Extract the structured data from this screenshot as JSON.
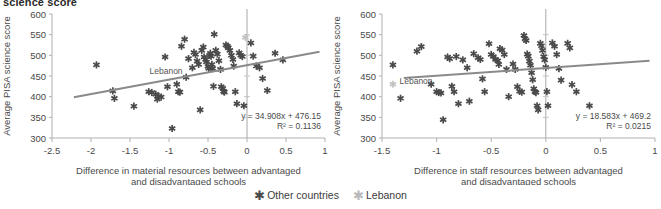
{
  "figure": {
    "title": "science score"
  },
  "legend": {
    "position": "bottom-center",
    "items": [
      {
        "label": "Other countries",
        "marker": "asterisk-icon",
        "color": "#4a4a4a"
      },
      {
        "label": "Lebanon",
        "marker": "asterisk-icon",
        "color": "#b9b9b9"
      }
    ]
  },
  "chart_data": [
    {
      "type": "scatter",
      "panel": "left",
      "title": "",
      "xlabel": "Difference in material resources between advantaged and disadvantaged schools",
      "xlabel_line1": "Difference in material resources between advantaged",
      "xlabel_line2": "and disadvantaged schools",
      "ylabel": "Average PISA science score",
      "xlim": [
        -2.5,
        1
      ],
      "ylim": [
        300,
        600
      ],
      "xticks": [
        "-2.5",
        "-2",
        "-1.5",
        "-1",
        "-0.5",
        "0",
        "0.5",
        "1"
      ],
      "xtick_values": [
        -2.5,
        -2,
        -1.5,
        -1,
        -0.5,
        0,
        0.5,
        1
      ],
      "yticks": [
        "300",
        "350",
        "400",
        "450",
        "500",
        "550",
        "600"
      ],
      "ytick_values": [
        300,
        350,
        400,
        450,
        500,
        550,
        600
      ],
      "grid": false,
      "zero_line_x": 0,
      "trendline": {
        "equation": "y = 34.908x + 476.15",
        "r2_text": "R² = 0.1136",
        "slope": 34.908,
        "intercept": 476.15,
        "r2": 0.1136,
        "color": "#8a8a8a",
        "label": "Lebanon",
        "label_x": -1.25,
        "label_y": 455
      },
      "series": [
        {
          "name": "Other countries",
          "color": "#4a4a4a",
          "points": [
            [
              -1.93,
              477
            ],
            [
              -1.72,
              414
            ],
            [
              -1.7,
              396
            ],
            [
              -1.45,
              377
            ],
            [
              -1.26,
              412
            ],
            [
              -1.22,
              410
            ],
            [
              -1.17,
              406
            ],
            [
              -1.15,
              394
            ],
            [
              -1.13,
              401
            ],
            [
              -1.1,
              399
            ],
            [
              -1.05,
              496
            ],
            [
              -1.02,
              424
            ],
            [
              -0.96,
              323
            ],
            [
              -0.9,
              430
            ],
            [
              -0.88,
              412
            ],
            [
              -0.86,
              411
            ],
            [
              -0.84,
              522
            ],
            [
              -0.8,
              539
            ],
            [
              -0.78,
              447
            ],
            [
              -0.75,
              492
            ],
            [
              -0.7,
              470
            ],
            [
              -0.68,
              507
            ],
            [
              -0.66,
              502
            ],
            [
              -0.64,
              486
            ],
            [
              -0.62,
              478
            ],
            [
              -0.6,
              368
            ],
            [
              -0.58,
              512
            ],
            [
              -0.56,
              520
            ],
            [
              -0.55,
              496
            ],
            [
              -0.53,
              490
            ],
            [
              -0.52,
              484
            ],
            [
              -0.5,
              473
            ],
            [
              -0.49,
              468
            ],
            [
              -0.48,
              500
            ],
            [
              -0.47,
              505
            ],
            [
              -0.46,
              498
            ],
            [
              -0.45,
              478
            ],
            [
              -0.44,
              468
            ],
            [
              -0.43,
              425
            ],
            [
              -0.42,
              551
            ],
            [
              -0.4,
              512
            ],
            [
              -0.38,
              503
            ],
            [
              -0.36,
              487
            ],
            [
              -0.34,
              466
            ],
            [
              -0.33,
              424
            ],
            [
              -0.31,
              420
            ],
            [
              -0.3,
              413
            ],
            [
              -0.29,
              411
            ],
            [
              -0.27,
              525
            ],
            [
              -0.25,
              522
            ],
            [
              -0.24,
              518
            ],
            [
              -0.22,
              512
            ],
            [
              -0.2,
              500
            ],
            [
              -0.18,
              490
            ],
            [
              -0.17,
              474
            ],
            [
              -0.15,
              412
            ],
            [
              -0.13,
              383
            ],
            [
              -0.1,
              506
            ],
            [
              -0.08,
              500
            ],
            [
              -0.06,
              497
            ],
            [
              -0.04,
              378
            ],
            [
              0.05,
              530
            ],
            [
              0.08,
              498
            ],
            [
              0.12,
              474
            ],
            [
              0.16,
              470
            ],
            [
              0.2,
              444
            ],
            [
              0.26,
              415
            ],
            [
              0.36,
              505
            ],
            [
              0.46,
              489
            ]
          ]
        },
        {
          "name": "Lebanon",
          "color": "#c2c2c2",
          "points": [
            [
              -0.02,
              543
            ]
          ]
        }
      ]
    },
    {
      "type": "scatter",
      "panel": "right",
      "title": "",
      "xlabel": "Difference in staff resources between advantaged and disadvantaged schools",
      "xlabel_line1": "Difference in staff resources between advantaged",
      "xlabel_line2": "and disadvantaged schools",
      "ylabel": "Average PISA science score",
      "xlim": [
        -1.5,
        1
      ],
      "ylim": [
        300,
        600
      ],
      "xticks": [
        "-1.5",
        "-1",
        "-0.5",
        "0",
        "0.5",
        "1"
      ],
      "xtick_values": [
        -1.5,
        -1,
        -0.5,
        0,
        0.5,
        1
      ],
      "yticks": [
        "300",
        "350",
        "400",
        "450",
        "500",
        "550",
        "600"
      ],
      "ytick_values": [
        300,
        350,
        400,
        450,
        500,
        550,
        600
      ],
      "grid": false,
      "zero_line_x": 0,
      "trendline": {
        "equation": "y = 18.583x + 469.2",
        "r2_text": "R² = 0.0215",
        "slope": 18.583,
        "intercept": 469.2,
        "r2": 0.0215,
        "color": "#8a8a8a",
        "label": "Lebanon",
        "label_x": -1.34,
        "label_y": 430
      },
      "series": [
        {
          "name": "Other countries",
          "color": "#4a4a4a",
          "points": [
            [
              -1.4,
              477
            ],
            [
              -1.33,
              396
            ],
            [
              -1.18,
              510
            ],
            [
              -1.14,
              521
            ],
            [
              -1.05,
              430
            ],
            [
              -1.0,
              412
            ],
            [
              -0.98,
              410
            ],
            [
              -0.96,
              409
            ],
            [
              -0.94,
              344
            ],
            [
              -0.9,
              496
            ],
            [
              -0.88,
              492
            ],
            [
              -0.86,
              425
            ],
            [
              -0.84,
              412
            ],
            [
              -0.82,
              497
            ],
            [
              -0.8,
              383
            ],
            [
              -0.76,
              489
            ],
            [
              -0.72,
              470
            ],
            [
              -0.7,
              389
            ],
            [
              -0.66,
              504
            ],
            [
              -0.62,
              494
            ],
            [
              -0.6,
              490
            ],
            [
              -0.58,
              443
            ],
            [
              -0.56,
              412
            ],
            [
              -0.52,
              528
            ],
            [
              -0.5,
              502
            ],
            [
              -0.48,
              497
            ],
            [
              -0.46,
              490
            ],
            [
              -0.44,
              487
            ],
            [
              -0.43,
              478
            ],
            [
              -0.42,
              516
            ],
            [
              -0.4,
              513
            ],
            [
              -0.38,
              502
            ],
            [
              -0.36,
              466
            ],
            [
              -0.34,
              400
            ],
            [
              -0.3,
              479
            ],
            [
              -0.28,
              466
            ],
            [
              -0.26,
              424
            ],
            [
              -0.24,
              413
            ],
            [
              -0.22,
              411
            ],
            [
              -0.2,
              548
            ],
            [
              -0.19,
              540
            ],
            [
              -0.18,
              536
            ],
            [
              -0.17,
              503
            ],
            [
              -0.16,
              498
            ],
            [
              -0.15,
              486
            ],
            [
              -0.14,
              476
            ],
            [
              -0.13,
              458
            ],
            [
              -0.12,
              441
            ],
            [
              -0.11,
              419
            ],
            [
              -0.1,
              412
            ],
            [
              -0.09,
              410
            ],
            [
              -0.08,
              378
            ],
            [
              -0.07,
              368
            ],
            [
              -0.05,
              529
            ],
            [
              -0.04,
              523
            ],
            [
              -0.03,
              512
            ],
            [
              -0.02,
              497
            ],
            [
              -0.01,
              489
            ],
            [
              0.0,
              471
            ],
            [
              0.01,
              412
            ],
            [
              0.02,
              378
            ],
            [
              0.06,
              530
            ],
            [
              0.08,
              522
            ],
            [
              0.1,
              502
            ],
            [
              0.12,
              468
            ],
            [
              0.14,
              440
            ],
            [
              0.2,
              529
            ],
            [
              0.22,
              518
            ],
            [
              0.24,
              429
            ],
            [
              0.28,
              412
            ],
            [
              0.4,
              378
            ]
          ]
        },
        {
          "name": "Lebanon",
          "color": "#c2c2c2",
          "points": [
            [
              -1.4,
              430
            ]
          ]
        }
      ]
    }
  ]
}
